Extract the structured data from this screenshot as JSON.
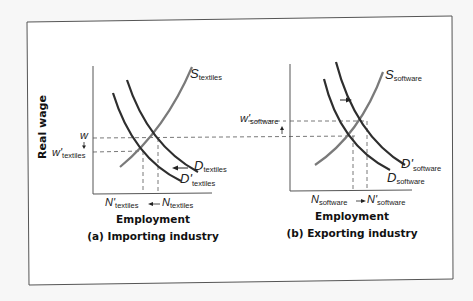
{
  "figure": {
    "y_axis_label": "Real wage",
    "panels": [
      {
        "id": "a",
        "x_axis_label": "Employment",
        "caption": "(a) Importing industry",
        "supply": {
          "main": "S",
          "sub": "textiles"
        },
        "demand": {
          "main": "D",
          "sub": "textiles"
        },
        "demand_shifted": {
          "main": "D'",
          "sub": "textiles"
        },
        "wage": {
          "main": "w",
          "sub": ""
        },
        "wage_new": {
          "main": "w'",
          "sub": "textiles"
        },
        "employment": {
          "main": "N",
          "sub": "textiles"
        },
        "employment_new": {
          "main": "N'",
          "sub": "textiles"
        },
        "shift_direction": "left"
      },
      {
        "id": "b",
        "x_axis_label": "Employment",
        "caption": "(b) Exporting industry",
        "supply": {
          "main": "S",
          "sub": "software"
        },
        "demand": {
          "main": "D",
          "sub": "software"
        },
        "demand_shifted": {
          "main": "D'",
          "sub": "software"
        },
        "wage_new": {
          "main": "w'",
          "sub": "software"
        },
        "employment": {
          "main": "N",
          "sub": "software"
        },
        "employment_new": {
          "main": "N'",
          "sub": "software"
        },
        "shift_direction": "right"
      }
    ],
    "colors": {
      "supply": "#7a7a7a",
      "demand": "#2e2e2e",
      "axis": "#555555",
      "dashed": "#555555",
      "frame": "#555555"
    }
  }
}
